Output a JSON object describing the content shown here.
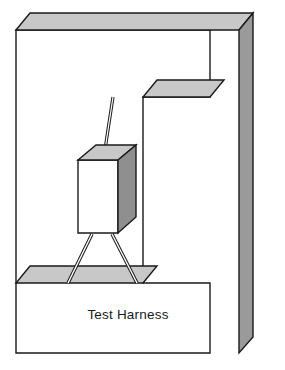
{
  "diagram": {
    "title": "Test Harness",
    "caption": "Test Harness",
    "type": "isometric-mechanical-fixture",
    "background_color": "#ffffff",
    "stroke_color": "#1a1a1a",
    "stroke_width": 1.4,
    "palette": {
      "front_face": "#ffffff",
      "top_bevel": "#c8c8c8",
      "side_face": "#9a9a9a",
      "shelf_top": "#c8c8c8",
      "dut_front": "#ffffff",
      "dut_top": "#c8c8c8",
      "dut_side": "#8f8f8f",
      "wire_fill": "#ffffff",
      "text": "#1a1a1a"
    },
    "parts": [
      {
        "name": "c-frame-body",
        "label": "C-frame front face",
        "fill": "#ffffff",
        "points": "16,30 210,30 210,97 143,97 143,283 210,283 210,353 16,353"
      },
      {
        "name": "c-frame-top-bevel",
        "label": "Top chamfer band",
        "fill": "#c8c8c8",
        "points": "16,30 30,13 253,13 239,30"
      },
      {
        "name": "c-frame-right-face",
        "label": "Right depth face",
        "fill": "#9a9a9a",
        "points": "239,30 253,13 253,337 239,353"
      },
      {
        "name": "notch-top-bevel",
        "label": "Notch upper chamfer",
        "fill": "#c8c8c8",
        "points": "143,97 210,97 224,80 157,80"
      },
      {
        "name": "shelf-top-face",
        "label": "Base shelf top surface",
        "fill": "#c8c8c8",
        "points": "16,283 143,283 157,266 30,266"
      },
      {
        "name": "dut-front-face",
        "label": "Device under test, front",
        "fill": "#ffffff",
        "points": "78,160 118,160 118,233 78,233"
      },
      {
        "name": "dut-top-face",
        "label": "Device under test, top",
        "fill": "#c8c8c8",
        "points": "78,160 118,160 136,145 96,145"
      },
      {
        "name": "dut-right-face",
        "label": "Device under test, right",
        "fill": "#8f8f8f",
        "points": "118,160 136,145 136,217 118,233"
      }
    ],
    "wires": [
      {
        "name": "upper-suspension-wire",
        "label": "Upper suspension wire",
        "from": [
          113,
          97
        ],
        "to": [
          104,
          156
        ],
        "width": 3.2
      },
      {
        "name": "left-support-leg",
        "label": "Left support leg",
        "from": [
          92,
          234
        ],
        "to": [
          68,
          283
        ],
        "width": 3.4
      },
      {
        "name": "right-support-leg",
        "label": "Right support leg",
        "from": [
          112,
          234
        ],
        "to": [
          137,
          283
        ],
        "width": 3.4
      }
    ],
    "caption_position": {
      "x": 128,
      "y": 319,
      "anchor": "middle"
    }
  }
}
